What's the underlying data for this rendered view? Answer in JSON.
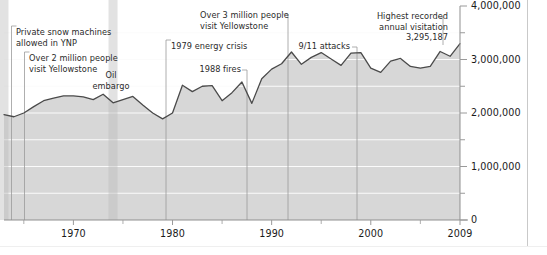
{
  "chart_data": {
    "type": "area",
    "title": "",
    "subtitle": "",
    "xlabel": "",
    "ylabel": "",
    "xlim": [
      1963,
      2009
    ],
    "ylim": [
      0,
      4000000
    ],
    "grid": true,
    "legend": "none",
    "series_name": "Annual visitation",
    "x_tick_labels": [
      "1970",
      "1980",
      "1990",
      "2000",
      "2009"
    ],
    "x_tick_values": [
      1970,
      1980,
      1990,
      2000,
      2009
    ],
    "y_tick_labels": [
      "0",
      "1,000,000",
      "2,000,000",
      "3,000,000",
      "4,000,000"
    ],
    "y_tick_values": [
      0,
      1000000,
      2000000,
      3000000,
      4000000
    ],
    "y_minor_tick_values": [
      500000,
      1500000,
      2500000,
      3500000
    ],
    "x": [
      1963,
      1964,
      1965,
      1966,
      1967,
      1968,
      1969,
      1970,
      1971,
      1972,
      1973,
      1974,
      1975,
      1976,
      1977,
      1978,
      1979,
      1980,
      1981,
      1982,
      1983,
      1984,
      1985,
      1986,
      1987,
      1988,
      1989,
      1990,
      1991,
      1992,
      1993,
      1994,
      1995,
      1996,
      1997,
      1998,
      1999,
      2000,
      2001,
      2002,
      2003,
      2004,
      2005,
      2006,
      2007,
      2008,
      2009
    ],
    "values": [
      1970000,
      1930000,
      2000000,
      2120000,
      2230000,
      2280000,
      2320000,
      2320000,
      2300000,
      2250000,
      2350000,
      2190000,
      2250000,
      2310000,
      2150000,
      2000000,
      1890000,
      2000000,
      2520000,
      2400000,
      2500000,
      2510000,
      2230000,
      2380000,
      2580000,
      2180000,
      2640000,
      2820000,
      2920000,
      3140000,
      2910000,
      3040000,
      3130000,
      3010000,
      2890000,
      3120000,
      3130000,
      2840000,
      2760000,
      2970000,
      3020000,
      2870000,
      2840000,
      2870000,
      3150000,
      3060000,
      3295187
    ],
    "annotations": [
      {
        "id": "private-snow-machines",
        "text_lines": [
          "Private snow machines",
          "allowed in YNP"
        ],
        "year": 1963,
        "align": "left"
      },
      {
        "id": "over-2-million",
        "text_lines": [
          "Over 2 million people",
          "visit Yellowstone"
        ],
        "year": 1965,
        "align": "left"
      },
      {
        "id": "oil-embargo",
        "text_lines": [
          "Oil",
          "embargo"
        ],
        "year": 1974,
        "align": "center"
      },
      {
        "id": "1979-energy-crisis",
        "text_lines": [
          "1979 energy crisis"
        ],
        "year": 1979,
        "align": "left"
      },
      {
        "id": "1988-fires",
        "text_lines": [
          "1988 fires"
        ],
        "year": 1988,
        "align": "right"
      },
      {
        "id": "over-3-million",
        "text_lines": [
          "Over 3 million people",
          "visit Yellowstone"
        ],
        "year": 1992,
        "align": "left"
      },
      {
        "id": "911-attacks",
        "text_lines": [
          "9/11 attacks"
        ],
        "year": 2001,
        "align": "right"
      },
      {
        "id": "highest-recorded",
        "text_lines": [
          "Highest recorded",
          "annual visitation",
          "3,295,187"
        ],
        "year": 2009,
        "align": "right"
      }
    ],
    "highlight_bands": [
      {
        "id": "snow-machines-band",
        "year": 1963
      },
      {
        "id": "oil-embargo-band",
        "year": 1974
      }
    ],
    "colors": {
      "area_fill": "#d7d7d7",
      "line": "#4a4a4a",
      "gridline": "#fbfbfb",
      "axis": "#9a9a9a",
      "annotation_text": "#2b2b2b",
      "tick_text": "#1a1a1a",
      "leader_line": "#9a9a9a",
      "background": "#ffffff"
    }
  },
  "annotations_text": {
    "private_snow_machines_l1": "Private snow machines",
    "private_snow_machines_l2": "allowed in YNP",
    "over_2_million_l1": "Over 2 million people",
    "over_2_million_l2": "visit Yellowstone",
    "oil_embargo_l1": "Oil",
    "oil_embargo_l2": "embargo",
    "energy_crisis": "1979 energy crisis",
    "fires_1988": "1988 fires",
    "over_3_million_l1": "Over 3 million people",
    "over_3_million_l2": "visit Yellowstone",
    "attacks_911": "9/11 attacks",
    "highest_l1": "Highest recorded",
    "highest_l2": "annual visitation",
    "highest_l3": "3,295,187"
  },
  "y_axis": {
    "t0": "0",
    "t1": "1,000,000",
    "t2": "2,000,000",
    "t3": "3,000,000",
    "t4": "4,000,000"
  },
  "x_axis": {
    "t0": "1970",
    "t1": "1980",
    "t2": "1990",
    "t3": "2000",
    "t4": "2009"
  }
}
